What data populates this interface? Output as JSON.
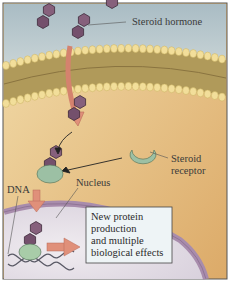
{
  "figure": {
    "labels": {
      "hormone": "Steroid hormone",
      "receptor_line1": "Steroid",
      "receptor_line2": "receptor",
      "nucleus": "Nucleus",
      "dna": "DNA"
    },
    "effect_box": {
      "lines": [
        "New protein",
        "production",
        "and multiple",
        "biological effects"
      ]
    },
    "colors": {
      "extracellular": "#b8c6cc",
      "cytoplasm": "#e8c48c",
      "membrane_head": "#f0dc96",
      "membrane_tail": "#a08a4c",
      "hormone": "#7a5870",
      "receptor": "#9cc0a4",
      "arrow": "#e0907a",
      "nucleus_envelope": "#a88cac",
      "nucleoplasm": "#e4dde6",
      "box_fill": "#eef4f6"
    }
  }
}
